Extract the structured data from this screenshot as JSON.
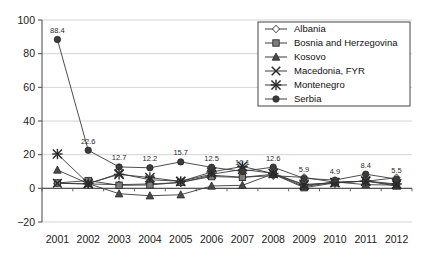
{
  "chart_data": {
    "type": "line",
    "title": "",
    "subtitle": "",
    "xlabel": "",
    "ylabel": "",
    "grid": true,
    "legend_position": "top-right",
    "categories": [
      "2001",
      "2002",
      "2003",
      "2004",
      "2005",
      "2006",
      "2007",
      "2008",
      "2009",
      "2010",
      "2011",
      "2012"
    ],
    "x": [
      2001,
      2002,
      2003,
      2004,
      2005,
      2006,
      2007,
      2008,
      2009,
      2010,
      2011,
      2012
    ],
    "ylim": [
      -20,
      100
    ],
    "yticks": [
      "100",
      "80",
      "60",
      "40",
      "20",
      "0",
      "−20"
    ],
    "ytick_values": [
      100,
      80,
      60,
      40,
      20,
      0,
      -20
    ],
    "series": [
      {
        "name": "Albania",
        "marker": "diamond",
        "values": [
          3.0,
          2.6,
          2.2,
          2.6,
          3.4,
          7.8,
          6.6,
          7.5,
          6.5,
          3.6,
          4.2,
          6.3
        ]
      },
      {
        "name": "Bosnia and Herzegovina",
        "marker": "square",
        "values": [
          3.2,
          4.6,
          1.8,
          2.0,
          3.6,
          7.0,
          6.5,
          8.4,
          0.4,
          3.2,
          4.4,
          1.4
        ]
      },
      {
        "name": "Kosovo",
        "marker": "triangle",
        "values": [
          10.9,
          2.8,
          -3.2,
          -4.4,
          -3.8,
          1.4,
          1.8,
          8.6,
          1.0,
          3.8,
          2.2,
          1.9
        ]
      },
      {
        "name": "Macedonia, FYR",
        "marker": "cross",
        "values": [
          3.0,
          2.7,
          8.8,
          5.1,
          4.2,
          8.4,
          11.2,
          8.9,
          1.8,
          3.5,
          4.3,
          2.1
        ]
      },
      {
        "name": "Montenegro",
        "marker": "asterisk",
        "values": [
          20.4,
          2.9,
          8.3,
          6.4,
          4.1,
          9.7,
          13.0,
          8.8,
          2.3,
          3.4,
          4.3,
          2.6
        ]
      },
      {
        "name": "Serbia",
        "marker": "circle",
        "values": [
          88.4,
          22.6,
          12.7,
          12.2,
          15.7,
          12.5,
          10.1,
          12.6,
          5.9,
          4.9,
          8.4,
          5.5
        ],
        "labels": [
          "88.4",
          "22.6",
          "12.7",
          "12.2",
          "15.7",
          "12.5",
          "10.1",
          "12.6",
          "5.9",
          "4.9",
          "8.4",
          "5.5"
        ],
        "labelled": true
      }
    ]
  },
  "legend": {
    "entries": [
      {
        "label": "Albania",
        "marker": "diamond"
      },
      {
        "label": "Bosnia and Herzegovina",
        "marker": "square"
      },
      {
        "label": "Kosovo",
        "marker": "triangle"
      },
      {
        "label": "Macedonia, FYR",
        "marker": "cross"
      },
      {
        "label": "Montenegro",
        "marker": "asterisk"
      },
      {
        "label": "Serbia",
        "marker": "circle"
      }
    ]
  },
  "colors": {
    "marker_fill": "#7d7d7d",
    "marker_stroke": "#2a2a2a",
    "line": "#3a3a3a",
    "grid": "#c9c9c9",
    "axis": "#555555",
    "text": "#111111",
    "background": "#ffffff"
  }
}
